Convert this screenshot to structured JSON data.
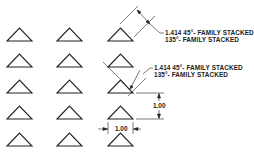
{
  "diagram": {
    "type": "triangle-array-dimension-drawing",
    "grid": {
      "columns": 3,
      "rows": 5
    },
    "colors": {
      "line": "#222222",
      "background": "#ffffff"
    },
    "callouts": [
      {
        "line1": "1.414 45°- FAMILY STACKED",
        "line2": "135°- FAMILY STACKED"
      },
      {
        "line1": "1.414 45°- FAMILY STACKED",
        "line2": "135°- FAMILY STACKED"
      }
    ],
    "dimensions": {
      "vertical": "1.00",
      "horizontal": "1.00"
    }
  }
}
